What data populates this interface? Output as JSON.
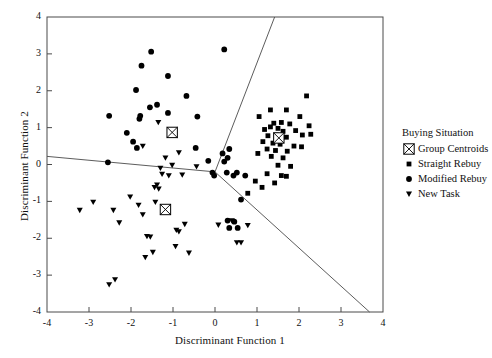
{
  "chart_data": {
    "type": "scatter",
    "title": "",
    "xlabel": "Discriminant Function 1",
    "ylabel": "Discriminant Function 2",
    "xlim": [
      -4,
      4
    ],
    "ylim": [
      -4,
      4
    ],
    "xticks": [
      -4,
      -3,
      -2,
      -1,
      0,
      1,
      2,
      3,
      4
    ],
    "yticks": [
      -4,
      -3,
      -2,
      -1,
      0,
      1,
      2,
      3,
      4
    ],
    "xtick_labels": [
      "-4",
      "-3",
      "-2",
      "-1",
      "0",
      "1",
      "2",
      "3",
      "4"
    ],
    "ytick_labels": [
      "-4",
      "-3",
      "-2",
      "-1",
      "0",
      "1",
      "2",
      "3",
      "4"
    ],
    "grid": false,
    "legend_position": "right",
    "legend_title": "Buying Situation",
    "series": [
      {
        "name": "Straight Rebuy",
        "marker": "square",
        "color": "#000000",
        "points": [
          [
            2.18,
            1.86
          ],
          [
            1.32,
            1.48
          ],
          [
            1.7,
            1.48
          ],
          [
            1.05,
            1.3
          ],
          [
            2.02,
            1.3
          ],
          [
            1.4,
            1.12
          ],
          [
            1.58,
            1.14
          ],
          [
            1.78,
            1.1
          ],
          [
            2.24,
            1.05
          ],
          [
            1.18,
            0.95
          ],
          [
            1.32,
            1.02
          ],
          [
            1.5,
            0.98
          ],
          [
            1.62,
            0.9
          ],
          [
            1.92,
            0.92
          ],
          [
            1.26,
            0.78
          ],
          [
            1.46,
            0.8
          ],
          [
            1.7,
            0.74
          ],
          [
            2.08,
            0.8
          ],
          [
            2.28,
            0.82
          ],
          [
            1.14,
            0.62
          ],
          [
            1.38,
            0.58
          ],
          [
            1.55,
            0.55
          ],
          [
            1.88,
            0.5
          ],
          [
            2.06,
            0.48
          ],
          [
            1.24,
            0.42
          ],
          [
            1.44,
            0.38
          ],
          [
            1.72,
            0.36
          ],
          [
            1.02,
            0.3
          ],
          [
            1.34,
            0.22
          ],
          [
            1.62,
            0.18
          ],
          [
            1.5,
            -0.02
          ],
          [
            1.8,
            -0.05
          ],
          [
            1.24,
            -0.25
          ],
          [
            1.58,
            -0.3
          ],
          [
            1.7,
            -0.32
          ],
          [
            0.96,
            -0.45
          ],
          [
            1.42,
            -0.5
          ],
          [
            1.12,
            -0.62
          ],
          [
            0.78,
            -0.78
          ]
        ]
      },
      {
        "name": "Modified Rebuy",
        "marker": "circle",
        "color": "#000000",
        "points": [
          [
            -1.52,
            3.06
          ],
          [
            0.22,
            3.12
          ],
          [
            -1.75,
            2.68
          ],
          [
            -1.12,
            2.4
          ],
          [
            -1.88,
            2.02
          ],
          [
            -0.68,
            1.86
          ],
          [
            -1.38,
            1.62
          ],
          [
            -1.55,
            1.55
          ],
          [
            -1.12,
            1.4
          ],
          [
            -2.52,
            1.32
          ],
          [
            -0.42,
            1.3
          ],
          [
            -1.78,
            1.32
          ],
          [
            -1.8,
            1.24
          ],
          [
            -2.1,
            0.86
          ],
          [
            -1.95,
            0.62
          ],
          [
            -1.86,
            0.45
          ],
          [
            -0.46,
            0.45
          ],
          [
            -0.16,
            0.1
          ],
          [
            -2.55,
            0.06
          ],
          [
            0.22,
            0.08
          ],
          [
            0.3,
            0.18
          ],
          [
            0.34,
            0.42
          ],
          [
            0.18,
            0.3
          ],
          [
            -0.06,
            -0.22
          ],
          [
            0.28,
            -0.22
          ],
          [
            0.52,
            -0.22
          ],
          [
            -0.02,
            -0.3
          ],
          [
            0.44,
            -0.3
          ],
          [
            0.72,
            -0.3
          ],
          [
            0.62,
            -0.95
          ],
          [
            0.3,
            -1.52
          ],
          [
            0.46,
            -1.55
          ],
          [
            0.34,
            -1.72
          ],
          [
            0.54,
            -1.72
          ]
        ]
      },
      {
        "name": "New Task",
        "marker": "triangle-down",
        "color": "#000000",
        "points": [
          [
            -1.35,
            1.14
          ],
          [
            -1.72,
            0.5
          ],
          [
            -0.86,
            0.32
          ],
          [
            -1.18,
            0.18
          ],
          [
            -1.02,
            -0.02
          ],
          [
            -1.3,
            -0.1
          ],
          [
            -0.44,
            -0.06
          ],
          [
            -1.26,
            -0.26
          ],
          [
            -1.1,
            -0.3
          ],
          [
            -0.78,
            -0.28
          ],
          [
            -1.38,
            -0.55
          ],
          [
            -1.44,
            -0.62
          ],
          [
            -1.34,
            -0.66
          ],
          [
            -2.02,
            -0.88
          ],
          [
            -1.42,
            -1.02
          ],
          [
            -1.82,
            -1.1
          ],
          [
            -2.42,
            -1.24
          ],
          [
            -3.22,
            -1.24
          ],
          [
            -2.9,
            -1.02
          ],
          [
            -1.72,
            -1.36
          ],
          [
            -0.72,
            -1.62
          ],
          [
            0.08,
            -1.64
          ],
          [
            0.78,
            -1.65
          ],
          [
            0.4,
            -1.52
          ],
          [
            -0.92,
            -1.78
          ],
          [
            -0.86,
            -1.82
          ],
          [
            -1.62,
            -1.95
          ],
          [
            -1.54,
            -1.96
          ],
          [
            -0.94,
            -2.22
          ],
          [
            0.62,
            -2.12
          ],
          [
            -1.48,
            -2.38
          ],
          [
            -0.62,
            -2.4
          ],
          [
            -1.66,
            -2.52
          ],
          [
            -2.38,
            -3.12
          ],
          [
            -2.52,
            -3.26
          ],
          [
            0.52,
            -2.12
          ],
          [
            -2.28,
            -1.58
          ]
        ]
      },
      {
        "name": "Group Centroids",
        "marker": "crossed-square",
        "color": "#000000",
        "points": [
          [
            -1.02,
            0.87
          ],
          [
            1.52,
            0.72
          ],
          [
            -1.18,
            -1.22
          ]
        ]
      }
    ],
    "boundary_lines": [
      {
        "name": "left-boundary",
        "from": [
          -4.0,
          0.22
        ],
        "to": [
          0.0,
          -0.2
        ]
      },
      {
        "name": "upper-boundary",
        "from": [
          0.0,
          -0.2
        ],
        "to": [
          1.42,
          4.0
        ]
      },
      {
        "name": "lower-right-boundary",
        "from": [
          0.0,
          -0.2
        ],
        "to": [
          3.68,
          -4.0
        ]
      }
    ]
  },
  "axes": {
    "xlabel": "Discriminant Function 1",
    "ylabel": "Discriminant Function 2"
  },
  "legend": {
    "title": "Buying Situation",
    "items": [
      {
        "label": "Group Centroids",
        "marker": "crossed-square"
      },
      {
        "label": "Straight Rebuy",
        "marker": "square"
      },
      {
        "label": "Modified Rebuy",
        "marker": "circle"
      },
      {
        "label": "New Task",
        "marker": "triangle-down"
      }
    ]
  }
}
